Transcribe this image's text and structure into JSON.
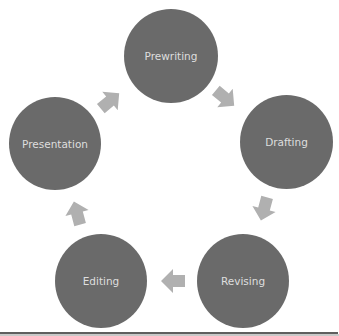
{
  "diagram": {
    "type": "cycle",
    "colors": {
      "node_fill": "#6a6a6a",
      "node_text": "#dedede",
      "arrow_fill": "#b0b0b0",
      "rule": "#5e5e5e"
    },
    "nodes": [
      {
        "id": "prewriting",
        "label": "Prewriting"
      },
      {
        "id": "drafting",
        "label": "Drafting"
      },
      {
        "id": "revising",
        "label": "Revising"
      },
      {
        "id": "editing",
        "label": "Editing"
      },
      {
        "id": "presentation",
        "label": "Presentation"
      }
    ],
    "edges": [
      {
        "from": "Prewriting",
        "to": "Drafting"
      },
      {
        "from": "Drafting",
        "to": "Revising"
      },
      {
        "from": "Revising",
        "to": "Editing"
      },
      {
        "from": "Editing",
        "to": "Presentation"
      },
      {
        "from": "Presentation",
        "to": "Prewriting"
      }
    ]
  }
}
